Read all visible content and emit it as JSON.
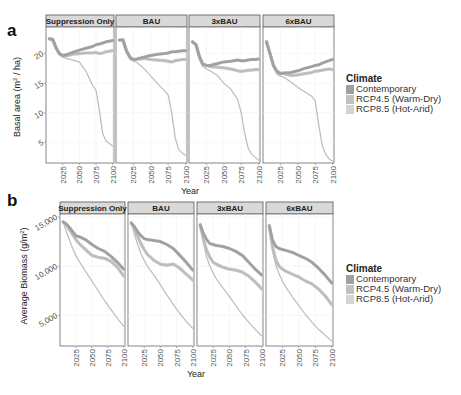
{
  "chart_data": [
    {
      "panel_label": "a",
      "type": "line",
      "ylabel": "Basal area (m² / ha)",
      "ylabel_parts": {
        "pre": "Basal area (m",
        "sup": "2",
        "post": " / ha)"
      },
      "xlabel": "Year",
      "yticks": [
        5,
        10,
        15,
        20
      ],
      "ytick_labels": [
        "5",
        "10",
        "15",
        "20"
      ],
      "ylim": [
        1.5,
        24.5
      ],
      "xticks": [
        2025,
        2050,
        2075,
        2100
      ],
      "xtick_labels": [
        "2025",
        "2050",
        "2075",
        "2100"
      ],
      "xlim": [
        2000,
        2102
      ],
      "legend_title": "Climate",
      "legend_position": "right",
      "x": [
        2005,
        2010,
        2015,
        2020,
        2025,
        2030,
        2040,
        2050,
        2060,
        2070,
        2075,
        2080,
        2085,
        2090,
        2095,
        2100
      ],
      "facets": [
        {
          "name": "Suppression Only",
          "series": [
            {
              "name": "Contemporary",
              "values": [
                22.5,
                22.4,
                21.0,
                20.0,
                19.7,
                19.8,
                20.2,
                20.6,
                20.9,
                21.2,
                21.5,
                21.6,
                21.8,
                22.0,
                22.1,
                22.2
              ]
            },
            {
              "name": "RCP4.5 (Warm-Dry)",
              "values": [
                22.5,
                22.4,
                21.0,
                20.0,
                19.6,
                19.6,
                19.9,
                20.0,
                20.1,
                20.1,
                20.2,
                20.0,
                20.1,
                20.3,
                20.4,
                20.5
              ]
            },
            {
              "name": "RCP8.5 (Hot-Arid)",
              "values": [
                22.5,
                22.4,
                21.0,
                19.8,
                19.4,
                19.2,
                18.9,
                18.6,
                17.0,
                14.6,
                13.8,
                10.5,
                6.5,
                5.2,
                4.8,
                4.4
              ]
            }
          ]
        },
        {
          "name": "BAU",
          "series": [
            {
              "name": "Contemporary",
              "values": [
                22.3,
                22.3,
                20.5,
                19.4,
                19.0,
                19.1,
                19.4,
                19.7,
                19.9,
                20.0,
                20.1,
                20.3,
                20.3,
                20.4,
                20.5,
                20.5
              ]
            },
            {
              "name": "RCP4.5 (Warm-Dry)",
              "values": [
                22.3,
                22.3,
                20.5,
                19.4,
                19.0,
                19.0,
                19.2,
                19.0,
                18.9,
                18.8,
                18.7,
                18.6,
                18.8,
                18.9,
                19.0,
                19.0
              ]
            },
            {
              "name": "RCP8.5 (Hot-Arid)",
              "values": [
                22.3,
                22.3,
                20.5,
                19.0,
                18.7,
                18.5,
                17.5,
                16.2,
                14.9,
                13.7,
                13.0,
                10.0,
                5.8,
                3.8,
                3.2,
                2.8
              ]
            }
          ]
        },
        {
          "name": "3xBAU",
          "series": [
            {
              "name": "Contemporary",
              "values": [
                22.0,
                21.5,
                19.5,
                18.2,
                18.0,
                18.0,
                18.3,
                18.6,
                18.7,
                18.9,
                18.8,
                18.8,
                18.9,
                19.0,
                19.0,
                19.1
              ]
            },
            {
              "name": "RCP4.5 (Warm-Dry)",
              "values": [
                22.0,
                21.5,
                19.5,
                18.2,
                18.0,
                17.8,
                17.7,
                17.6,
                17.4,
                17.1,
                17.0,
                17.1,
                17.2,
                17.2,
                17.3,
                17.3
              ]
            },
            {
              "name": "RCP8.5 (Hot-Arid)",
              "values": [
                22.0,
                21.5,
                19.0,
                17.8,
                17.4,
                17.1,
                16.4,
                15.0,
                14.0,
                12.2,
                10.0,
                6.5,
                4.0,
                3.0,
                2.5,
                2.0
              ]
            }
          ]
        },
        {
          "name": "6xBAU",
          "series": [
            {
              "name": "Contemporary",
              "values": [
                22.0,
                20.0,
                18.0,
                17.0,
                16.6,
                16.7,
                16.8,
                17.1,
                17.5,
                17.8,
                18.0,
                18.1,
                18.4,
                18.6,
                18.8,
                19.0
              ]
            },
            {
              "name": "RCP4.5 (Warm-Dry)",
              "values": [
                22.0,
                20.0,
                18.0,
                17.0,
                16.7,
                16.6,
                16.3,
                16.4,
                16.6,
                16.8,
                17.0,
                17.1,
                17.2,
                17.3,
                17.4,
                17.3
              ]
            },
            {
              "name": "RCP8.5 (Hot-Arid)",
              "values": [
                22.0,
                20.0,
                17.7,
                16.5,
                16.2,
                16.0,
                15.2,
                14.3,
                13.5,
                12.8,
                12.0,
                8.0,
                4.5,
                3.0,
                2.2,
                1.8
              ]
            }
          ]
        }
      ]
    },
    {
      "panel_label": "b",
      "type": "line",
      "ylabel": "Average Biomass (g/m²)",
      "ylabel_parts": {
        "pre": "Average Biomass (g/m",
        "sup": "2",
        "post": ")"
      },
      "xlabel": "Year",
      "yticks": [
        5000,
        10000,
        15000
      ],
      "ytick_labels": [
        "5,000",
        "10,000",
        "15,000"
      ],
      "ylim": [
        1900,
        15300
      ],
      "xticks": [
        2025,
        2050,
        2075,
        2100
      ],
      "xtick_labels": [
        "2025",
        "2050",
        "2075",
        "2100"
      ],
      "xlim": [
        2000,
        2102
      ],
      "legend_title": "Climate",
      "legend_position": "right",
      "x": [
        2005,
        2010,
        2015,
        2020,
        2025,
        2030,
        2040,
        2050,
        2060,
        2070,
        2080,
        2090,
        2100
      ],
      "facets": [
        {
          "name": "Suppression Only",
          "series": [
            {
              "name": "Contemporary",
              "values": [
                14500,
                14300,
                13900,
                13500,
                13100,
                13000,
                12700,
                12200,
                11800,
                11500,
                11000,
                10400,
                9700
              ]
            },
            {
              "name": "RCP4.5 (Warm-Dry)",
              "values": [
                14500,
                14200,
                13700,
                13200,
                12700,
                12300,
                11700,
                11100,
                10900,
                10800,
                10500,
                9900,
                9000
              ]
            },
            {
              "name": "RCP8.5 (Hot-Arid)",
              "values": [
                14500,
                13500,
                12600,
                11800,
                11100,
                10500,
                9500,
                8500,
                7500,
                6500,
                5600,
                4700,
                3900
              ]
            }
          ]
        },
        {
          "name": "BAU",
          "series": [
            {
              "name": "Contemporary",
              "values": [
                14400,
                14000,
                13500,
                13100,
                12800,
                12700,
                12600,
                12500,
                12200,
                11800,
                11100,
                10400,
                9600
              ]
            },
            {
              "name": "RCP4.5 (Warm-Dry)",
              "values": [
                14400,
                13800,
                13000,
                12300,
                11700,
                11200,
                10600,
                10200,
                10100,
                10200,
                9800,
                9200,
                8600
              ]
            },
            {
              "name": "RCP8.5 (Hot-Arid)",
              "values": [
                14400,
                13200,
                12200,
                11300,
                10600,
                10000,
                9100,
                8100,
                7100,
                6100,
                5200,
                4400,
                3700
              ]
            }
          ]
        },
        {
          "name": "3xBAU",
          "series": [
            {
              "name": "Contemporary",
              "values": [
                14200,
                13300,
                12700,
                12300,
                12200,
                12100,
                12000,
                11800,
                11500,
                11100,
                10400,
                9700,
                9100
              ]
            },
            {
              "name": "RCP4.5 (Warm-Dry)",
              "values": [
                14200,
                12700,
                11600,
                10900,
                10400,
                10200,
                9900,
                9700,
                9600,
                9400,
                9000,
                8400,
                7700
              ]
            },
            {
              "name": "RCP8.5 (Hot-Arid)",
              "values": [
                14200,
                12300,
                10900,
                10000,
                9300,
                8700,
                7800,
                6900,
                6000,
                5100,
                4300,
                3600,
                2900
              ]
            }
          ]
        },
        {
          "name": "6xBAU",
          "series": [
            {
              "name": "Contemporary",
              "values": [
                14100,
                12600,
                12000,
                11800,
                11700,
                11600,
                11400,
                11100,
                10800,
                10400,
                9800,
                9100,
                8300
              ]
            },
            {
              "name": "RCP4.5 (Warm-Dry)",
              "values": [
                14100,
                11900,
                10600,
                10000,
                9700,
                9500,
                9200,
                8900,
                8500,
                8200,
                7700,
                7000,
                6100
              ]
            },
            {
              "name": "RCP8.5 (Hot-Arid)",
              "values": [
                14100,
                11500,
                10100,
                9200,
                8500,
                7900,
                6900,
                6000,
                5100,
                4300,
                3600,
                3000,
                2400
              ]
            }
          ]
        }
      ]
    }
  ],
  "legend": {
    "title": "Climate",
    "items": [
      {
        "label": "Contemporary",
        "color": "#a0a0a0"
      },
      {
        "label": "RCP4.5 (Warm-Dry)",
        "color": "#c2c2c2"
      },
      {
        "label": "RCP8.5 (Hot-Arid)",
        "color": "#d4d4d4"
      }
    ]
  },
  "series_colors": {
    "Contemporary": "#a4a4a4",
    "RCP4.5 (Warm-Dry)": "#c4c4c4",
    "RCP8.5 (Hot-Arid)": "#c8c8c8"
  },
  "series_band_width": {
    "Contemporary": 3,
    "RCP4.5 (Warm-Dry)": 3.2,
    "RCP8.5 (Hot-Arid)": 1.2
  }
}
